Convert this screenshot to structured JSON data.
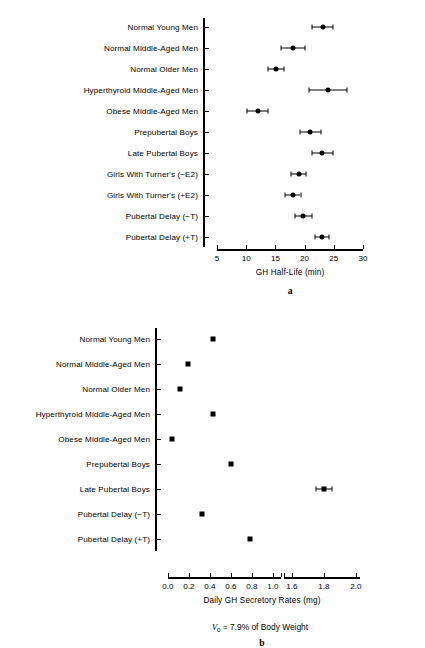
{
  "figure": {
    "caption_note_prefix": "V",
    "caption_note_sub": "0",
    "caption_note_rest": " = 7.9% of Body Weight"
  },
  "panel_a": {
    "letter": "a",
    "xlabel": "GH Half-Life (min)",
    "xticks": [
      "5",
      "10",
      "15",
      "20",
      "25",
      "30"
    ]
  },
  "panel_b": {
    "letter": "b",
    "xlabel": "Daily GH Secretory Rates (mg)",
    "xticks_left": [
      "0.0",
      "0.2",
      "0.4",
      "0.6",
      "0.8",
      "1.0"
    ],
    "xticks_right": [
      "1.6",
      "1.8",
      "2.0"
    ]
  },
  "chart_data": [
    {
      "type": "scatter",
      "panel": "a",
      "title": "",
      "xlabel": "GH Half-Life (min)",
      "ylabel": "",
      "xlim": [
        5,
        30
      ],
      "xticks": [
        5,
        10,
        15,
        20,
        25,
        30
      ],
      "grid": false,
      "legend": "none",
      "orientation": "horizontal",
      "error_bars": "symmetric",
      "categories": [
        "Normal Young Men",
        "Normal Middle-Aged Men",
        "Normal Older Men",
        "Hyperthyroid Middle-Aged Men",
        "Obese Middle-Aged Men",
        "Prepubertal Boys",
        "Late Pubertal Boys",
        "Girls With Turner's (−E2)",
        "Girls With Turner's (+E2)",
        "Pubertal Delay (−T)",
        "Pubertal Delay (+T)"
      ],
      "values": [
        23.1,
        18.0,
        15.1,
        24.0,
        12.0,
        21.0,
        23.0,
        19.0,
        18.0,
        19.8,
        23.0
      ],
      "errors": [
        1.8,
        2.0,
        1.3,
        3.3,
        1.8,
        1.8,
        1.8,
        1.3,
        1.3,
        1.5,
        1.2
      ]
    },
    {
      "type": "scatter",
      "panel": "b",
      "title": "",
      "xlabel": "Daily GH Secretory Rates (mg)",
      "ylabel": "",
      "xlim": [
        0.0,
        2.0
      ],
      "xticks": [
        0.0,
        0.2,
        0.4,
        0.6,
        0.8,
        1.0,
        1.6,
        1.8,
        2.0
      ],
      "axis_break": [
        1.0,
        1.6
      ],
      "grid": false,
      "legend": "none",
      "orientation": "horizontal",
      "error_bars": "symmetric",
      "categories": [
        "Normal Young Men",
        "Normal Middle-Aged Men",
        "Normal Older Men",
        "Hyperthyroid Middle-Aged Men",
        "Obese Middle-Aged Men",
        "Prepubertal Boys",
        "Late Pubertal Boys",
        "Pubertal Delay (−T)",
        "Pubertal Delay (+T)"
      ],
      "values": [
        0.43,
        0.19,
        0.115,
        0.43,
        0.035,
        0.6,
        1.8,
        0.32,
        0.78
      ],
      "errors": [
        0,
        0,
        0,
        0,
        0,
        0,
        0.05,
        0,
        0
      ]
    }
  ]
}
